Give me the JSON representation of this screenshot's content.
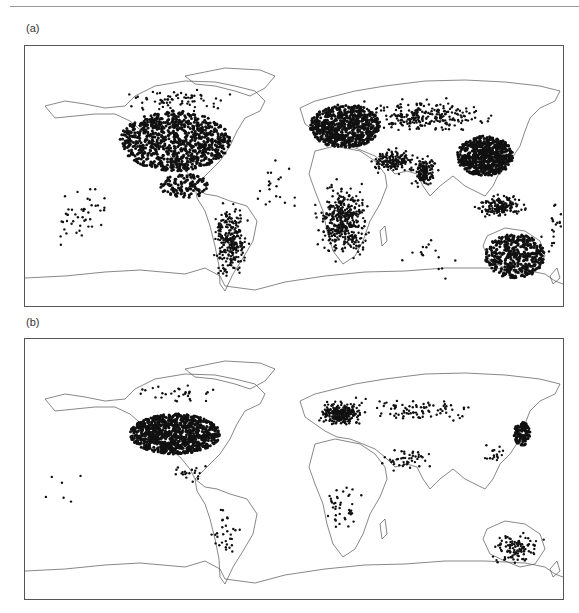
{
  "figure": {
    "panels": [
      {
        "id": "a",
        "label": "(a)",
        "frame": {
          "left": 24,
          "top": 45,
          "width": 538,
          "height": 260
        },
        "density": "high",
        "regions": [
          {
            "name": "north-america",
            "cx": 150,
            "cy": 95,
            "rx": 55,
            "ry": 30,
            "n": 900,
            "fill": true
          },
          {
            "name": "central-america",
            "cx": 160,
            "cy": 140,
            "rx": 25,
            "ry": 12,
            "n": 120,
            "fill": true
          },
          {
            "name": "canada",
            "cx": 150,
            "cy": 55,
            "rx": 70,
            "ry": 15,
            "n": 70,
            "fill": false
          },
          {
            "name": "south-america",
            "cx": 205,
            "cy": 195,
            "rx": 22,
            "ry": 45,
            "n": 260,
            "fill": false
          },
          {
            "name": "europe",
            "cx": 320,
            "cy": 80,
            "rx": 35,
            "ry": 22,
            "n": 700,
            "fill": true
          },
          {
            "name": "russia",
            "cx": 400,
            "cy": 70,
            "rx": 80,
            "ry": 20,
            "n": 260,
            "fill": false
          },
          {
            "name": "middle-east",
            "cx": 370,
            "cy": 115,
            "rx": 30,
            "ry": 15,
            "n": 160,
            "fill": false
          },
          {
            "name": "africa",
            "cx": 318,
            "cy": 175,
            "rx": 30,
            "ry": 45,
            "n": 420,
            "fill": false
          },
          {
            "name": "india",
            "cx": 400,
            "cy": 125,
            "rx": 15,
            "ry": 18,
            "n": 140,
            "fill": false
          },
          {
            "name": "china",
            "cx": 460,
            "cy": 110,
            "rx": 28,
            "ry": 20,
            "n": 650,
            "fill": true
          },
          {
            "name": "se-asia",
            "cx": 475,
            "cy": 160,
            "rx": 30,
            "ry": 15,
            "n": 160,
            "fill": false
          },
          {
            "name": "australia",
            "cx": 490,
            "cy": 210,
            "rx": 30,
            "ry": 22,
            "n": 420,
            "fill": true
          },
          {
            "name": "pacific",
            "cx": 50,
            "cy": 170,
            "rx": 40,
            "ry": 35,
            "n": 45,
            "fill": false
          },
          {
            "name": "pacific-east",
            "cx": 530,
            "cy": 180,
            "rx": 20,
            "ry": 40,
            "n": 25,
            "fill": false
          },
          {
            "name": "atlantic",
            "cx": 250,
            "cy": 140,
            "rx": 30,
            "ry": 50,
            "n": 20,
            "fill": false
          },
          {
            "name": "indian-ocean",
            "cx": 400,
            "cy": 210,
            "rx": 40,
            "ry": 30,
            "n": 15,
            "fill": false
          }
        ]
      },
      {
        "id": "b",
        "label": "(b)",
        "frame": {
          "left": 24,
          "top": 338,
          "width": 538,
          "height": 260
        },
        "density": "low",
        "regions": [
          {
            "name": "usa",
            "cx": 150,
            "cy": 95,
            "rx": 45,
            "ry": 20,
            "n": 950,
            "fill": true
          },
          {
            "name": "canada",
            "cx": 150,
            "cy": 55,
            "rx": 60,
            "ry": 12,
            "n": 30,
            "fill": false
          },
          {
            "name": "central-america",
            "cx": 165,
            "cy": 135,
            "rx": 25,
            "ry": 10,
            "n": 20,
            "fill": false
          },
          {
            "name": "south-america",
            "cx": 200,
            "cy": 195,
            "rx": 18,
            "ry": 35,
            "n": 30,
            "fill": false
          },
          {
            "name": "europe",
            "cx": 315,
            "cy": 75,
            "rx": 25,
            "ry": 15,
            "n": 260,
            "fill": false
          },
          {
            "name": "russia",
            "cx": 390,
            "cy": 70,
            "rx": 80,
            "ry": 18,
            "n": 90,
            "fill": false
          },
          {
            "name": "middle-east",
            "cx": 380,
            "cy": 120,
            "rx": 35,
            "ry": 15,
            "n": 45,
            "fill": false
          },
          {
            "name": "africa",
            "cx": 318,
            "cy": 170,
            "rx": 28,
            "ry": 40,
            "n": 40,
            "fill": false
          },
          {
            "name": "japan",
            "cx": 497,
            "cy": 95,
            "rx": 8,
            "ry": 12,
            "n": 120,
            "fill": true
          },
          {
            "name": "china-coast",
            "cx": 470,
            "cy": 115,
            "rx": 15,
            "ry": 15,
            "n": 18,
            "fill": false
          },
          {
            "name": "australia",
            "cx": 490,
            "cy": 210,
            "rx": 30,
            "ry": 20,
            "n": 110,
            "fill": false
          },
          {
            "name": "pacific",
            "cx": 40,
            "cy": 160,
            "rx": 30,
            "ry": 40,
            "n": 6,
            "fill": false
          }
        ]
      }
    ],
    "coastline_color": "#555555",
    "dot_color": "#111111",
    "frame_color": "#555555"
  }
}
